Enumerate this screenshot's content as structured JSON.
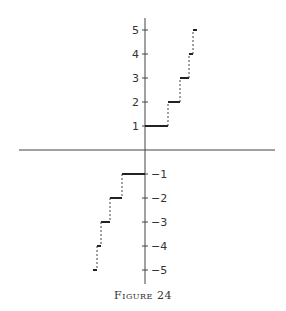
{
  "figure": {
    "caption": "Figure 24"
  },
  "chart_data": {
    "type": "line",
    "subtype": "step",
    "title": "",
    "caption": "Figure 24",
    "xlabel": "",
    "ylabel": "",
    "ylim": [
      -5,
      5
    ],
    "grid": false,
    "legend": null,
    "y_ticks": [
      5,
      4,
      3,
      2,
      1,
      -1,
      -2,
      -3,
      -4,
      -5
    ],
    "y_tick_labels": [
      "5",
      "4",
      "3",
      "2",
      "1",
      "-1",
      "-2",
      "-3",
      "-4",
      "-5"
    ],
    "x_ticks": [],
    "segments_note": "Horizontal solid segments at each integer level, joined by dashed vertical risers; segment widths shrink as |y| grows (x in pixel-units relative to origin, 24px ≈ 1 y-unit).",
    "series": [
      {
        "name": "step function",
        "segments": [
          {
            "y": 1,
            "x_start": 0,
            "x_end": 23
          },
          {
            "y": 2,
            "x_start": 23,
            "x_end": 35
          },
          {
            "y": 3,
            "x_start": 35,
            "x_end": 44
          },
          {
            "y": 4,
            "x_start": 44,
            "x_end": 48
          },
          {
            "y": 5,
            "x_start": 48,
            "x_end": 52
          },
          {
            "y": -1,
            "x_start": -23,
            "x_end": 0
          },
          {
            "y": -2,
            "x_start": -35,
            "x_end": -23
          },
          {
            "y": -3,
            "x_start": -44,
            "x_end": -35
          },
          {
            "y": -4,
            "x_start": -48,
            "x_end": -44
          },
          {
            "y": -5,
            "x_start": -52,
            "x_end": -48
          }
        ],
        "risers": [
          {
            "x": 23,
            "y_from": 1,
            "y_to": 2
          },
          {
            "x": 35,
            "y_from": 2,
            "y_to": 3
          },
          {
            "x": 44,
            "y_from": 3,
            "y_to": 4
          },
          {
            "x": 48,
            "y_from": 4,
            "y_to": 5
          },
          {
            "x": -23,
            "y_from": -1,
            "y_to": -2
          },
          {
            "x": -35,
            "y_from": -2,
            "y_to": -3
          },
          {
            "x": -44,
            "y_from": -3,
            "y_to": -4
          },
          {
            "x": -48,
            "y_from": -4,
            "y_to": -5
          }
        ]
      }
    ]
  }
}
